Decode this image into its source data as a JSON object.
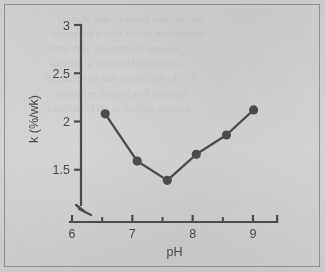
{
  "figure": {
    "background_color": "#d4d4d4",
    "ink_color": "#4a4a52",
    "border_color": "#8e8e94"
  },
  "ghost_text": {
    "line1": "scanned page showing reaction rate",
    "line2": "versus pH profile for the degradation",
    "line3": "of the drug substance in aqueous",
    "line4": "solution at elevated temperature",
    "line5": "the minimum rate occurs near pH 7.6",
    "line6": "indicating general acid and base",
    "line7": "catalysis of the hydrolysis reaction"
  },
  "chart_data": {
    "type": "line",
    "title": "",
    "xlabel": "pH",
    "ylabel": "k (%/wk)",
    "xlim": [
      6,
      9.4
    ],
    "ylim": [
      1.25,
      3
    ],
    "grid": false,
    "legend": "none",
    "axis_break": {
      "axis": "x",
      "symbol": "zigzag",
      "position": 6.25,
      "label": "axis-break"
    },
    "x_ticks_major": [
      6,
      7,
      8,
      9
    ],
    "x_tick_labels": [
      "6",
      "7",
      "8",
      "9"
    ],
    "x_ticks_minor": [
      6.5,
      7.5,
      8.5
    ],
    "y_ticks_major": [
      1.5,
      2,
      2.5,
      3
    ],
    "y_tick_labels": [
      "1.5",
      "2",
      "2.5",
      "3"
    ],
    "marker": "filled-circle",
    "marker_color": "#4a4a52",
    "line_color": "#4a4a52",
    "series": [
      {
        "name": "k vs pH",
        "x": [
          6.55,
          7.08,
          7.58,
          8.06,
          8.56,
          9.01
        ],
        "y": [
          2.08,
          1.59,
          1.39,
          1.66,
          1.86,
          2.12
        ]
      }
    ],
    "points": [
      {
        "ph": 6.55,
        "k": 2.08
      },
      {
        "ph": 7.08,
        "k": 1.59
      },
      {
        "ph": 7.58,
        "k": 1.39
      },
      {
        "ph": 8.06,
        "k": 1.66
      },
      {
        "ph": 8.56,
        "k": 1.86
      },
      {
        "ph": 9.01,
        "k": 2.12
      }
    ]
  }
}
